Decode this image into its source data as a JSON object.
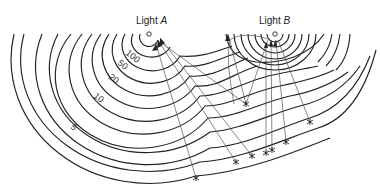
{
  "figure": {
    "sources": [
      {
        "id": "A",
        "prefix": "Light ",
        "name": "A",
        "x": 149,
        "y": 34
      },
      {
        "id": "B",
        "prefix": "Light ",
        "name": "B",
        "x": 275,
        "y": 34
      }
    ],
    "contour_labels": [
      {
        "text": "100",
        "x": 127,
        "y": 56,
        "rot": 38
      },
      {
        "text": "50",
        "x": 118,
        "y": 67,
        "rot": 38
      },
      {
        "text": "20",
        "x": 106,
        "y": 82,
        "rot": 38
      },
      {
        "text": "10",
        "x": 90,
        "y": 100,
        "rot": 38
      },
      {
        "text": "5",
        "x": 72,
        "y": 127,
        "rot": 38
      }
    ],
    "colors": {
      "ink": "#222222",
      "background": "#ffffff"
    }
  }
}
